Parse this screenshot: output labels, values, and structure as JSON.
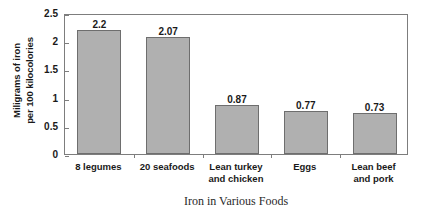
{
  "chart_data": {
    "type": "bar",
    "title": "Iron in Various Foods",
    "xlabel": "Iron in Various Foods",
    "ylabel_lines": [
      "Miligrams of iron",
      "per 100 kilocolories"
    ],
    "ylabel": "Miligrams of iron per 100 kilocolories",
    "categories": [
      "8 legumes",
      "20 seafoods",
      "Lean turkey and chicken",
      "Eggs",
      "Lean beef and pork"
    ],
    "category_lines": [
      [
        "8 legumes"
      ],
      [
        "20 seafoods"
      ],
      [
        "Lean turkey",
        "and chicken"
      ],
      [
        "Eggs"
      ],
      [
        "Lean beef",
        "and pork"
      ]
    ],
    "values": [
      2.2,
      2.07,
      0.87,
      0.77,
      0.73
    ],
    "value_labels": [
      "2.2",
      "2.07",
      "0.87",
      "0.77",
      "0.73"
    ],
    "ylim": [
      0,
      2.5
    ],
    "ytick_values": [
      0,
      0.5,
      1,
      1.5,
      2,
      2.5
    ],
    "ytick_labels": [
      "0",
      "0.5",
      "1",
      "1.5",
      "2",
      "2.5"
    ],
    "grid": false,
    "legend": "none",
    "bar_color": "#b0b0b0",
    "bar_border_color": "#6e6e6e",
    "axis_color": "#7d7d7d",
    "background_color": "#ffffff",
    "text_color": "#1a1a1a"
  }
}
